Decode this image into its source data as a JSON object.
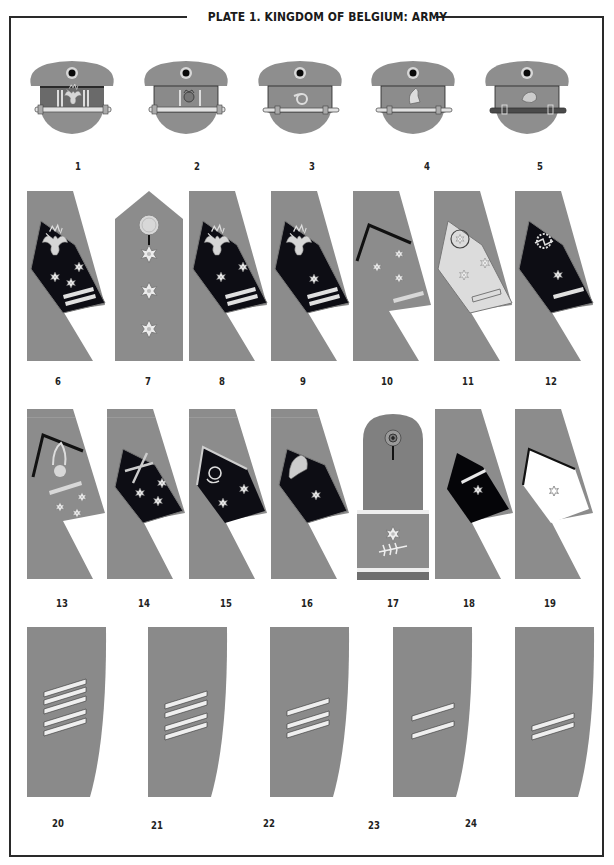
{
  "plate": {
    "title": "PLATE 1. KINGDOM OF BELGIUM: ARMY",
    "colors": {
      "khaki_gray": "#8c8c8c",
      "dark_patch": "#0d0d12",
      "frame": "#2a2a2a",
      "braid": "#dcdcdc"
    }
  },
  "rows": [
    {
      "row": 1,
      "type": "peaked-caps",
      "items": [
        {
          "number": "1",
          "band": "dark",
          "badge": "lion-wreath",
          "bars": 2
        },
        {
          "number": "2",
          "band": "gray",
          "badge": "crown",
          "bars": 2
        },
        {
          "number": "3",
          "band": "gray",
          "badge": "hunting-horn",
          "bars": 0
        },
        {
          "number": "4",
          "band": "gray",
          "badge": "horse-head",
          "bars": 0
        },
        {
          "number": "5",
          "band": "gray",
          "badge": "lion-head",
          "bars": 0,
          "strap": "dark"
        }
      ]
    },
    {
      "row": 2,
      "type": "collar-patches-and-shoulder-strap",
      "items": [
        {
          "number": "6",
          "patch": "dark",
          "emblem": "eagle",
          "stars": 3,
          "bars": 2
        },
        {
          "number": "7",
          "kind": "shoulder-strap",
          "stars": 3
        },
        {
          "number": "8",
          "patch": "dark",
          "emblem": "eagle",
          "stars": 2,
          "bars": 2
        },
        {
          "number": "9",
          "patch": "dark",
          "emblem": "eagle",
          "stars": 1,
          "bars": 2
        },
        {
          "number": "10",
          "patch": "gray-piped",
          "stars": 3,
          "bars": 1
        },
        {
          "number": "11",
          "patch": "light",
          "emblem": "wreath-star",
          "stars": 2,
          "bars": 1
        },
        {
          "number": "12",
          "patch": "dark",
          "emblem": "cogwheel-lightning",
          "stars": 1,
          "bars": 1
        }
      ]
    },
    {
      "row": 3,
      "type": "collar-patches-and-shoulder-strap",
      "items": [
        {
          "number": "13",
          "patch": "gray-piped",
          "emblem": "grenade",
          "stars": 3,
          "bars": 1
        },
        {
          "number": "14",
          "patch": "dark",
          "emblem": "crossed-cannons",
          "stars": 3
        },
        {
          "number": "15",
          "patch": "dark-light-piped",
          "emblem": "hunting-horn",
          "stars": 2
        },
        {
          "number": "16",
          "patch": "dark",
          "emblem": "helmet",
          "stars": 1
        },
        {
          "number": "17",
          "kind": "shoulder-strap-with-slide",
          "stars": 1,
          "emblem": "laurel-branch"
        },
        {
          "number": "18",
          "patch": "dark",
          "stars": 1,
          "bars": 1
        },
        {
          "number": "19",
          "patch": "white-dark-piped",
          "stars": 1
        }
      ]
    },
    {
      "row": 4,
      "type": "sleeve-chevrons",
      "items": [
        {
          "number": "20",
          "stripes": 5
        },
        {
          "number": "21",
          "stripes": 4
        },
        {
          "number": "22",
          "stripes": 3
        },
        {
          "number": "23",
          "stripes": 2
        },
        {
          "number": "24",
          "stripes": 2
        }
      ]
    }
  ]
}
